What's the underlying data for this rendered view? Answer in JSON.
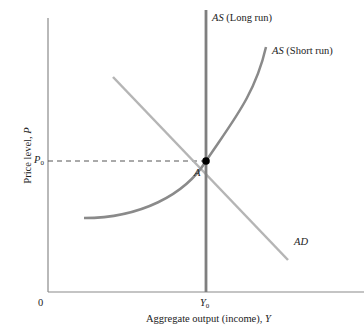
{
  "diagram": {
    "type": "AD-AS model",
    "axes": {
      "x_label_text": "Aggregate output (income), ",
      "x_label_var": "Y",
      "y_label_text": "Price level, ",
      "y_label_var": "P",
      "origin_label": "0"
    },
    "ticks": {
      "x_tick_var": "Y",
      "x_tick_sub": "0",
      "y_tick_var": "P",
      "y_tick_sub": "0"
    },
    "curves": {
      "lras": {
        "label_var": "AS",
        "label_text": " (Long run)",
        "color": "#8a8a8a"
      },
      "sras": {
        "label_var": "AS",
        "label_text": " (Short run)",
        "color": "#8a8a8a"
      },
      "ad": {
        "label_var": "AD",
        "color": "#b0b0b0"
      }
    },
    "equilibrium": {
      "label": "A",
      "color": "#000000"
    }
  }
}
